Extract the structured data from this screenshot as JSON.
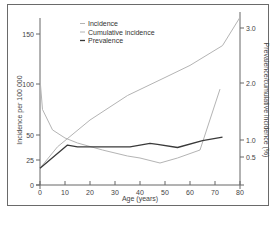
{
  "chart_data": {
    "type": "line",
    "title": "",
    "xlabel": "Age (years)",
    "ylabel": "Incidence per 100 000",
    "y2label": "Prevalence/cumulative incidence (%)",
    "xlim": [
      0,
      80
    ],
    "ylim": [
      0,
      165
    ],
    "y2lim": [
      0,
      3.3
    ],
    "x_ticks": [
      0,
      10,
      20,
      30,
      40,
      50,
      60,
      70,
      80
    ],
    "y_ticks": [
      0,
      25,
      50,
      100,
      150
    ],
    "y2_ticks": [
      0.5,
      1.0,
      2.0,
      3.0
    ],
    "y2_tick_labels": [
      "0.5",
      "1.0",
      "2.0",
      "3.0"
    ],
    "grid": false,
    "legend_position": "upper-left-inside",
    "series": [
      {
        "name": "Incidence",
        "axis": "left",
        "color": "#b4b4b4",
        "x": [
          0,
          1,
          5,
          10,
          15,
          25,
          35,
          40,
          48,
          55,
          64,
          72
        ],
        "y": [
          105,
          75,
          55,
          47,
          42,
          35,
          29,
          27,
          22,
          27,
          35,
          95
        ]
      },
      {
        "name": "Cumulative incidence",
        "axis": "right",
        "color": "#b4b4b4",
        "x": [
          0,
          7,
          20,
          35,
          50,
          60,
          73,
          80
        ],
        "y": [
          0.3,
          0.8,
          1.35,
          1.78,
          2.1,
          2.32,
          2.68,
          3.2
        ]
      },
      {
        "name": "Prevalence",
        "axis": "right",
        "color": "#3a3a3a",
        "x": [
          0,
          11,
          15,
          36,
          44,
          47,
          55,
          65,
          73
        ],
        "y": [
          0.3,
          0.85,
          0.8,
          0.8,
          0.9,
          0.87,
          0.78,
          0.98,
          1.05
        ]
      }
    ]
  },
  "legend": {
    "items": [
      {
        "label": "Incidence",
        "color": "#b4b4b4"
      },
      {
        "label": "Cumulative incidence",
        "color": "#b4b4b4"
      },
      {
        "label": "Prevalence",
        "color": "#3a3a3a"
      }
    ]
  },
  "axes": {
    "x_title": "Age (years)",
    "y_left_title": "Incidence per 100 000",
    "y_right_title": "Prevalence/cumulative incidence (%)"
  }
}
